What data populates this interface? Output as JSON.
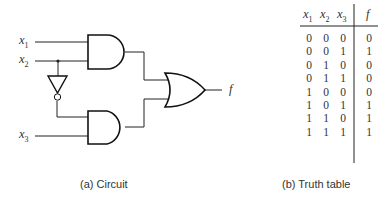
{
  "figure": {
    "circuit": {
      "caption": "(a) Circuit",
      "inputs": [
        {
          "name": "x",
          "sub": "1"
        },
        {
          "name": "x",
          "sub": "2"
        },
        {
          "name": "x",
          "sub": "3"
        }
      ],
      "output": "f",
      "gates": [
        {
          "type": "AND",
          "inputs": [
            "x1",
            "x2"
          ]
        },
        {
          "type": "NOT",
          "inputs": [
            "x2"
          ]
        },
        {
          "type": "AND",
          "inputs": [
            "NOT x2",
            "x3"
          ]
        },
        {
          "type": "OR",
          "inputs": [
            "AND1",
            "AND2"
          ],
          "output": "f"
        }
      ]
    },
    "truth_table": {
      "caption": "(b) Truth table",
      "headers": [
        {
          "name": "x",
          "sub": "1"
        },
        {
          "name": "x",
          "sub": "2"
        },
        {
          "name": "x",
          "sub": "3"
        },
        {
          "name": "f",
          "sub": ""
        }
      ],
      "rows": [
        [
          "0",
          "0",
          "0",
          "0"
        ],
        [
          "0",
          "0",
          "1",
          "1"
        ],
        [
          "0",
          "1",
          "0",
          "0"
        ],
        [
          "0",
          "1",
          "1",
          "0"
        ],
        [
          "1",
          "0",
          "0",
          "0"
        ],
        [
          "1",
          "0",
          "1",
          "1"
        ],
        [
          "1",
          "1",
          "0",
          "1"
        ],
        [
          "1",
          "1",
          "1",
          "1"
        ]
      ]
    }
  }
}
